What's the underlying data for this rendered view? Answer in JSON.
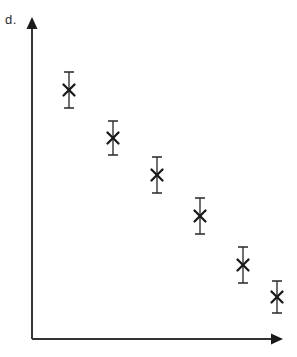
{
  "figure": {
    "panel_label": "d.",
    "width": 297,
    "height": 357,
    "background_color": "#ffffff",
    "ink_color": "#333333",
    "marker_color": "#1a1a1a"
  },
  "axes": {
    "origin_x": 32,
    "origin_y": 339,
    "y_axis_top": 17,
    "x_axis_right": 283,
    "line_width": 2,
    "arrowheads": true,
    "x_axis_label": "",
    "y_axis_label": "",
    "x_tick_labels": [],
    "y_tick_labels": [],
    "grid": false
  },
  "chart_data": {
    "type": "scatter",
    "title": "d.",
    "xlabel": "",
    "ylabel": "",
    "legend": [],
    "grid": false,
    "marker": "x",
    "errorbars": true,
    "xlim": [
      0,
      1
    ],
    "ylim": [
      0,
      1
    ],
    "x": [
      0.147,
      0.323,
      0.498,
      0.669,
      0.841,
      0.976
    ],
    "y": [
      0.773,
      0.624,
      0.51,
      0.382,
      0.23,
      0.131
    ],
    "yerr": [
      0.056,
      0.053,
      0.056,
      0.056,
      0.056,
      0.05
    ],
    "points": [
      {
        "index": 1,
        "px": 69,
        "py": 90,
        "err_px": 18,
        "x": 0.147,
        "y": 0.773,
        "yerr": 0.056
      },
      {
        "index": 2,
        "px": 113,
        "py": 138,
        "err_px": 17,
        "x": 0.323,
        "y": 0.624,
        "yerr": 0.053
      },
      {
        "index": 3,
        "px": 157,
        "py": 175,
        "err_px": 18,
        "x": 0.498,
        "y": 0.51,
        "yerr": 0.056
      },
      {
        "index": 4,
        "px": 200,
        "py": 216,
        "err_px": 18,
        "x": 0.669,
        "y": 0.382,
        "yerr": 0.056
      },
      {
        "index": 5,
        "px": 243,
        "py": 265,
        "err_px": 18,
        "x": 0.841,
        "y": 0.23,
        "yerr": 0.056
      },
      {
        "index": 6,
        "px": 277,
        "py": 297,
        "err_px": 16,
        "x": 0.976,
        "y": 0.131,
        "yerr": 0.05
      }
    ],
    "annotations": []
  }
}
